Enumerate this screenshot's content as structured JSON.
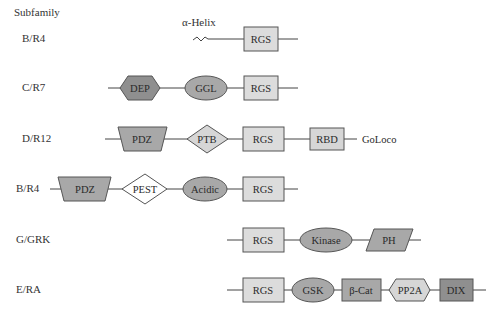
{
  "header": {
    "title": "Subfamily"
  },
  "colors": {
    "rgs_fill": "#dcdcdc",
    "light_fill": "#d6d6d6",
    "mid_fill": "#a8a8a8",
    "dark_fill": "#8f8f8f",
    "white_fill": "#ffffff",
    "stroke": "#555555",
    "line": "#444444"
  },
  "rows": [
    {
      "subfamily": "B/R4",
      "domains": [
        {
          "name": "α-Helix",
          "shape": "wavy-line"
        },
        {
          "name": "RGS",
          "shape": "rectangle"
        }
      ]
    },
    {
      "subfamily": "C/R7",
      "domains": [
        {
          "name": "DEP",
          "shape": "hexagon"
        },
        {
          "name": "GGL",
          "shape": "ellipse"
        },
        {
          "name": "RGS",
          "shape": "rectangle"
        }
      ]
    },
    {
      "subfamily": "D/R12",
      "domains": [
        {
          "name": "PDZ",
          "shape": "trapezoid"
        },
        {
          "name": "PTB",
          "shape": "diamond"
        },
        {
          "name": "RGS",
          "shape": "rectangle"
        },
        {
          "name": "RBD",
          "shape": "rectangle"
        },
        {
          "name": "GoLoco",
          "shape": "text"
        }
      ]
    },
    {
      "subfamily": "B/R4",
      "domains": [
        {
          "name": "PDZ",
          "shape": "trapezoid"
        },
        {
          "name": "PEST",
          "shape": "diamond"
        },
        {
          "name": "Acidic",
          "shape": "ellipse"
        },
        {
          "name": "RGS",
          "shape": "rectangle"
        }
      ]
    },
    {
      "subfamily": "G/GRK",
      "domains": [
        {
          "name": "RGS",
          "shape": "rectangle"
        },
        {
          "name": "Kinase",
          "shape": "ellipse"
        },
        {
          "name": "PH",
          "shape": "parallelogram"
        }
      ]
    },
    {
      "subfamily": "E/RA",
      "domains": [
        {
          "name": "RGS",
          "shape": "rectangle"
        },
        {
          "name": "GSK",
          "shape": "ellipse"
        },
        {
          "name": "β-Cat",
          "shape": "rectangle"
        },
        {
          "name": "PP2A",
          "shape": "hexagon"
        },
        {
          "name": "DIX",
          "shape": "rectangle"
        }
      ]
    }
  ]
}
